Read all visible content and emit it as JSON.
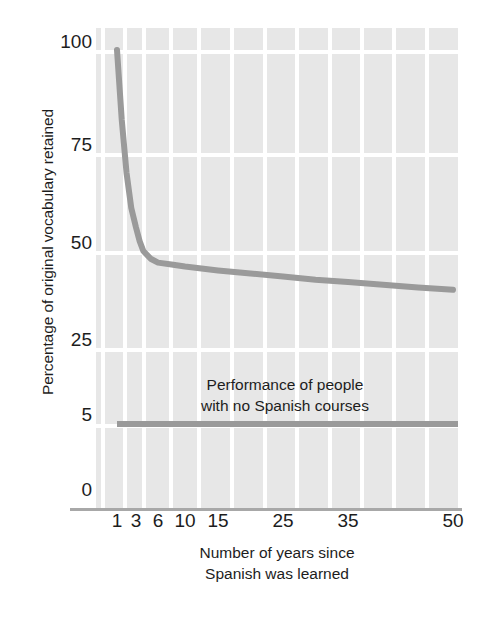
{
  "chart_data": {
    "type": "line",
    "title": "",
    "xlabel": "Number of years since Spanish was learned",
    "xlabel_lines": [
      "Number of years since",
      "Spanish was learned"
    ],
    "ylabel": "Percentage of original vocabulary retained",
    "x_ticks": [
      1,
      3,
      6,
      10,
      15,
      25,
      35,
      50
    ],
    "x_tick_labels": [
      "1",
      "3",
      "6",
      "10",
      "15",
      "25",
      "35",
      "50"
    ],
    "y_ticks": [
      0,
      5,
      25,
      50,
      75,
      100
    ],
    "y_tick_labels": [
      "0",
      "5",
      "25",
      "50",
      "75",
      "100"
    ],
    "ylim": [
      0,
      100
    ],
    "xlim": [
      1,
      50
    ],
    "x_scale": "log-like",
    "grid": true,
    "grid_color": "#ffffff",
    "plot_background": "#e7e7e7",
    "line_color": "#9a9a9a",
    "legend": "none",
    "series": [
      {
        "name": "Retention of original Spanish vocabulary",
        "x": [
          1,
          1.5,
          2,
          2.5,
          3,
          3.5,
          4,
          5,
          6,
          8,
          10,
          15,
          20,
          25,
          30,
          35,
          40,
          45,
          50
        ],
        "values": [
          100,
          83,
          70,
          61,
          56,
          52.5,
          50,
          48,
          47,
          46.5,
          46,
          45,
          44.2,
          43.4,
          42.6,
          42,
          41.3,
          40.6,
          40
        ]
      },
      {
        "name": "Performance of people with no Spanish courses",
        "x": [
          1,
          50
        ],
        "values": [
          5,
          5
        ]
      }
    ],
    "annotations": [
      {
        "text": "Performance of people with no Spanish courses",
        "lines": [
          "Performance of people",
          "with no Spanish courses"
        ],
        "x": 12,
        "y": 14
      }
    ]
  },
  "axes": {
    "y_title": "Percentage of original vocabulary retained",
    "x_title_line1": "Number of years since",
    "x_title_line2": "Spanish was learned",
    "y_ticks": [
      {
        "label": "100",
        "top": 32
      },
      {
        "label": "75",
        "top": 135
      },
      {
        "label": "50",
        "top": 233
      },
      {
        "label": "25",
        "top": 330
      },
      {
        "label": "5",
        "top": 405
      },
      {
        "label": "0",
        "top": 480
      }
    ],
    "x_ticks": [
      {
        "label": "1",
        "left": 21
      },
      {
        "label": "3",
        "left": 40
      },
      {
        "label": "6",
        "left": 62
      },
      {
        "label": "10",
        "left": 89
      },
      {
        "label": "15",
        "left": 122
      },
      {
        "label": "25",
        "left": 187
      },
      {
        "label": "35",
        "left": 252
      },
      {
        "label": "50",
        "left": 357
      }
    ]
  },
  "annotation": {
    "line1": "Performance of people",
    "line2": "with no Spanish courses"
  },
  "colors": {
    "line": "#9a9a9a",
    "baseline": "#9a9a9a",
    "plot_bg": "#e7e7e7",
    "grid": "#ffffff",
    "axis": "#a8a8a8",
    "text": "#1d1d1d",
    "page_bg": "#ffffff"
  }
}
